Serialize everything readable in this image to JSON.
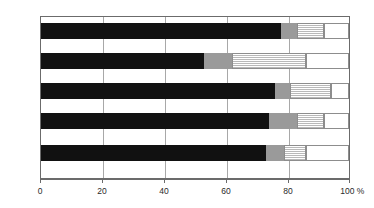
{
  "chart_data": {
    "type": "bar",
    "orientation": "horizontal",
    "stacked": true,
    "normalized": true,
    "title": "",
    "xlabel": "%",
    "ylabel": "",
    "xlim": [
      0,
      100
    ],
    "grid": true,
    "legend": "none",
    "categories": [
      "神着",
      "伊豆",
      "伊ケ谷",
      "阿古",
      "坪田"
    ],
    "tick_labels": [
      "0",
      "20",
      "40",
      "60",
      "80",
      "100 %"
    ],
    "tick_values": [
      0,
      20,
      40,
      60,
      80,
      100
    ],
    "series": [
      {
        "name": "black",
        "fill": "solid-black",
        "color": "#111111",
        "values": [
          78,
          53,
          76,
          74,
          73
        ]
      },
      {
        "name": "gray",
        "fill": "solid-gray",
        "color": "#9a9a9a",
        "values": [
          5,
          9,
          5,
          9,
          6
        ]
      },
      {
        "name": "hatched",
        "fill": "horizontal-hatch",
        "color": "#b9b9b9",
        "values": [
          9,
          24,
          13,
          9,
          7
        ]
      },
      {
        "name": "white",
        "fill": "open-white",
        "color": "#ffffff",
        "values": [
          8,
          14,
          6,
          8,
          14
        ]
      }
    ]
  },
  "axis": {
    "unit_suffix": "%",
    "labels": {
      "t0": "0",
      "t20": "20",
      "t40": "40",
      "t60": "60",
      "t80": "80",
      "t100": "100 %"
    }
  },
  "categories": {
    "c0": "神着",
    "c1": "伊豆",
    "c2": "伊ケ谷",
    "c3": "阿古",
    "c4": "坪田"
  },
  "colors": {
    "segment_black": "#111111",
    "segment_gray": "#9a9a9a",
    "segment_hatch": "#b9b9b9",
    "segment_white": "#ffffff",
    "axis": "#6b6b6b",
    "grid": "#a8a8a8"
  }
}
